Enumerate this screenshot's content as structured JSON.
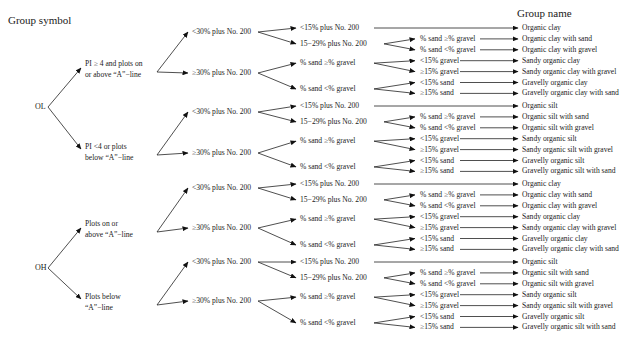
{
  "headers": {
    "left": "Group symbol",
    "right": "Group name"
  },
  "tree": [
    {
      "symbol": "OL",
      "branches": [
        {
          "condition": [
            "PI ≥ 4 and plots on",
            "or above “A”−line"
          ],
          "fines": [
            {
              "label": "<30% plus No. 200",
              "sub": [
                {
                  "label": "<15% plus No. 200",
                  "leaves": [
                    {
                      "cond": "",
                      "name": "Organic clay"
                    }
                  ]
                },
                {
                  "label": "15−29% plus No. 200",
                  "leaves": [
                    {
                      "cond": "% sand ≥% gravel",
                      "name": "Organic clay with sand"
                    },
                    {
                      "cond": "% sand <% gravel",
                      "name": "Organic clay with gravel"
                    }
                  ]
                }
              ]
            },
            {
              "label": "≥30% plus No. 200",
              "sub": [
                {
                  "label": "% sand ≥% gravel",
                  "leaves": [
                    {
                      "cond": "<15% gravel",
                      "name": "Sandy organic clay"
                    },
                    {
                      "cond": "≥15% gravel",
                      "name": "Sandy organic clay with gravel"
                    }
                  ]
                },
                {
                  "label": "% sand <% gravel",
                  "leaves": [
                    {
                      "cond": "<15% sand",
                      "name": "Gravelly organic clay"
                    },
                    {
                      "cond": "≥15% sand",
                      "name": "Gravelly organic clay with sand"
                    }
                  ]
                }
              ]
            }
          ]
        },
        {
          "condition": [
            "PI <4 or plots",
            "below “A”−line"
          ],
          "fines": [
            {
              "label": "<30% plus No. 200",
              "sub": [
                {
                  "label": "<15% plus No. 200",
                  "leaves": [
                    {
                      "cond": "",
                      "name": "Organic silt"
                    }
                  ]
                },
                {
                  "label": "15−29% plus No. 200",
                  "leaves": [
                    {
                      "cond": "% sand ≥% gravel",
                      "name": "Organic silt with sand"
                    },
                    {
                      "cond": "% sand <% gravel",
                      "name": "Organic silt with gravel"
                    }
                  ]
                }
              ]
            },
            {
              "label": "≥30% plus No. 200",
              "sub": [
                {
                  "label": "% sand ≥% gravel",
                  "leaves": [
                    {
                      "cond": "<15% gravel",
                      "name": "Sandy organic silt"
                    },
                    {
                      "cond": "≥15% gravel",
                      "name": "Sandy organic silt with gravel"
                    }
                  ]
                },
                {
                  "label": "% sand <% gravel",
                  "leaves": [
                    {
                      "cond": "<15% sand",
                      "name": "Gravelly organic silt"
                    },
                    {
                      "cond": "≥15% sand",
                      "name": "Gravelly organic silt with sand"
                    }
                  ]
                }
              ]
            }
          ]
        }
      ]
    },
    {
      "symbol": "OH",
      "branches": [
        {
          "condition": [
            "Plots on or",
            "above “A”−line"
          ],
          "fines": [
            {
              "label": "<30% plus No. 200",
              "sub": [
                {
                  "label": "<15% plus No. 200",
                  "leaves": [
                    {
                      "cond": "",
                      "name": "Organic clay"
                    }
                  ]
                },
                {
                  "label": "15−29% plus No. 200",
                  "leaves": [
                    {
                      "cond": "% sand ≥% gravel",
                      "name": "Organic clay with sand"
                    },
                    {
                      "cond": "% sand <% gravel",
                      "name": "Organic clay with gravel"
                    }
                  ]
                }
              ]
            },
            {
              "label": "≥30% plus No. 200",
              "sub": [
                {
                  "label": "% sand ≥% gravel",
                  "leaves": [
                    {
                      "cond": "<15% gravel",
                      "name": "Sandy organic clay"
                    },
                    {
                      "cond": "≥15% gravel",
                      "name": "Sandy organic clay with gravel"
                    }
                  ]
                },
                {
                  "label": "% sand <% gravel",
                  "leaves": [
                    {
                      "cond": "<15% sand",
                      "name": "Gravelly organic clay"
                    },
                    {
                      "cond": "≥15% sand",
                      "name": "Gravelly organic clay with sand"
                    }
                  ]
                }
              ]
            }
          ]
        },
        {
          "condition": [
            "Plots below",
            "“A”−line"
          ],
          "fines": [
            {
              "label": "<30% plus No. 200",
              "sub": [
                {
                  "label": "<15% plus No. 200",
                  "leaves": [
                    {
                      "cond": "",
                      "name": "Organic silt"
                    }
                  ]
                },
                {
                  "label": "15−29% plus No. 200",
                  "leaves": [
                    {
                      "cond": "% sand ≥% gravel",
                      "name": "Organic silt with sand"
                    },
                    {
                      "cond": "% sand <% gravel",
                      "name": "Organic silt with gravel"
                    }
                  ]
                }
              ]
            },
            {
              "label": "≥30% plus No. 200",
              "sub": [
                {
                  "label": "% sand ≥% gravel",
                  "leaves": [
                    {
                      "cond": "<15% gravel",
                      "name": "Sandy organic silt"
                    },
                    {
                      "cond": "≥15% gravel",
                      "name": "Sandy organic silt with gravel"
                    }
                  ]
                },
                {
                  "label": "% sand <% gravel",
                  "leaves": [
                    {
                      "cond": "<15% sand",
                      "name": "Gravelly organic silt"
                    },
                    {
                      "cond": "≥15% sand",
                      "name": "Gravelly organic silt with sand"
                    }
                  ]
                }
              ]
            }
          ]
        }
      ]
    }
  ]
}
